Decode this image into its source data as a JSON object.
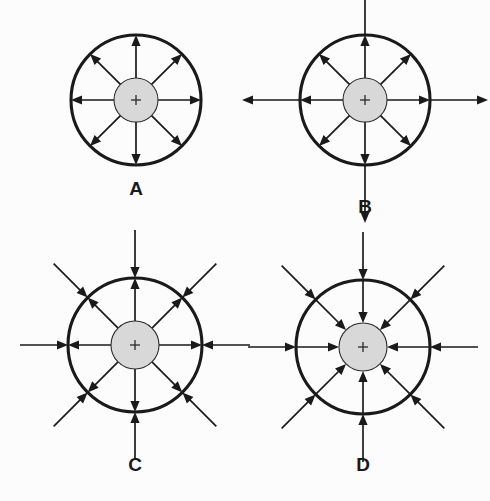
{
  "figure": {
    "background_color": "#fcfcfc",
    "width": 490,
    "height": 501,
    "line_color": "#1a1a1a",
    "inner_fill_color": "#d8d8d8",
    "inner_stroke_color": "#2b2b2b",
    "outer_stroke_width": 3.1,
    "ray_stroke_width": 1.7,
    "label_font_size": 19
  },
  "geometry": {
    "ray_angles_deg": [
      0,
      45,
      90,
      135,
      180,
      225,
      270,
      315
    ],
    "cardinal_angles_deg": [
      0,
      90,
      180,
      270
    ],
    "diagonal_angles_deg": [
      45,
      135,
      225,
      315
    ],
    "arrow_head_length": 11,
    "arrow_head_half_width": 4.6,
    "plus_half_size": 5
  },
  "panels": [
    {
      "id": "panel-a",
      "label": "A",
      "cx": 136,
      "cy": 100,
      "outer_r": 65,
      "inner_r": 22,
      "label_x": 136,
      "label_y": 190,
      "field_direction": "outward",
      "description": "Arrows point outward from the charged inner sphere and terminate at the outer circle.",
      "rays_inside": "outward-to-outer-circle",
      "rays_outside": "none",
      "outside_extension": 0
    },
    {
      "id": "panel-b",
      "label": "B",
      "cx": 365,
      "cy": 100,
      "outer_r": 65,
      "inner_r": 22,
      "label_x": 365,
      "label_y": 208,
      "field_direction": "outward",
      "description": "Arrows point outward from the inner sphere; the four cardinal arrows continue past the outer circle.",
      "rays_inside": "outward-to-outer-circle",
      "rays_outside": "outward-cardinal-only",
      "outside_extension": 58
    },
    {
      "id": "panel-c",
      "label": "C",
      "cx": 135,
      "cy": 345,
      "outer_r": 67,
      "inner_r": 24,
      "label_x": 135,
      "label_y": 466,
      "field_direction": "outward-inside-inward-outside",
      "description": "Inside the outer circle arrows point outward from the sphere; outside the outer circle arrows point inward toward it.",
      "rays_inside": "outward-to-outer-circle",
      "rays_outside": "inward-all-eight",
      "outside_extension": 48
    },
    {
      "id": "panel-d",
      "label": "D",
      "cx": 363,
      "cy": 347,
      "outer_r": 67,
      "inner_r": 24,
      "label_x": 363,
      "label_y": 466,
      "field_direction": "inward",
      "description": "Arrows point inward from outside, cross the outer circle and converge on the inner sphere.",
      "rays_inside": "inward-to-inner-circle",
      "rays_outside": "inward-all-eight",
      "outside_extension": 48
    }
  ]
}
